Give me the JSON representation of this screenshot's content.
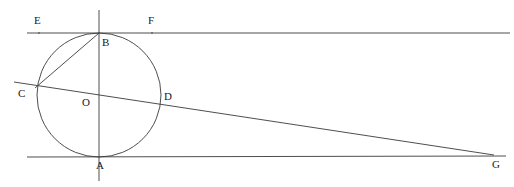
{
  "figure": {
    "type": "euclidean-geometry-diagram",
    "background_color": "#ffffff",
    "stroke_color": "#3a3a3a",
    "label_color": "#1a1a1a",
    "width": 514,
    "height": 187,
    "circle": {
      "name": "circle-O",
      "center_x": 99,
      "center_y": 95,
      "radius": 62
    },
    "points": [
      {
        "id": "A",
        "label": "A",
        "x": 99,
        "y": 157,
        "label_x": 96,
        "label_y": 160,
        "role": "bottom-tangency-point"
      },
      {
        "id": "B",
        "label": "B",
        "x": 99,
        "y": 33,
        "label_x": 102,
        "label_y": 37,
        "role": "top-tangency-point"
      },
      {
        "id": "C",
        "label": "C",
        "x": 35,
        "y": 88,
        "label_x": 18,
        "label_y": 88,
        "role": "secant-circle-intersection-left"
      },
      {
        "id": "D",
        "label": "D",
        "x": 163,
        "y": 97,
        "label_x": 164,
        "label_y": 91,
        "role": "secant-circle-intersection-right"
      },
      {
        "id": "E",
        "label": "E",
        "x": 39,
        "y": 33,
        "label_x": 34,
        "label_y": 15,
        "role": "upper-line-point-left"
      },
      {
        "id": "F",
        "label": "F",
        "x": 152,
        "y": 33,
        "label_x": 148,
        "label_y": 15,
        "role": "upper-line-point-right"
      },
      {
        "id": "G",
        "label": "G",
        "x": 494,
        "y": 155,
        "label_x": 492,
        "label_y": 159,
        "role": "secant-lower-line-intersection"
      },
      {
        "id": "O",
        "label": "O",
        "x": 99,
        "y": 95,
        "label_x": 82,
        "label_y": 97,
        "role": "circle-center"
      }
    ],
    "lines": [
      {
        "id": "upper-horizontal",
        "label": "EF",
        "x1": 27,
        "y1": 33,
        "x2": 510,
        "y2": 33,
        "kind": "tangent-at-B"
      },
      {
        "id": "lower-horizontal",
        "label": "AG",
        "x1": 27,
        "y1": 157,
        "x2": 506,
        "y2": 156,
        "kind": "tangent-at-A"
      },
      {
        "id": "vertical-diameter",
        "label": "AB",
        "x1": 99,
        "y1": 10,
        "x2": 99,
        "y2": 181,
        "kind": "diameter"
      },
      {
        "id": "secant-CDG",
        "label": "CDG",
        "x1": 14,
        "y1": 82,
        "x2": 494,
        "y2": 155,
        "kind": "secant"
      },
      {
        "id": "chord-BC",
        "label": "BC",
        "x1": 99,
        "y1": 33,
        "x2": 35,
        "y2": 88,
        "kind": "chord"
      }
    ]
  }
}
